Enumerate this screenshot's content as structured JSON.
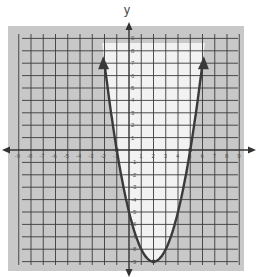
{
  "chart_data": {
    "type": "line",
    "title": "",
    "xlabel": "",
    "ylabel": "y",
    "xlim": [
      -9,
      9
    ],
    "ylim": [
      -9,
      9
    ],
    "grid": true,
    "x_ticks": [
      -9,
      -8,
      -7,
      -6,
      -5,
      -4,
      -3,
      -2,
      -1,
      1,
      2,
      3,
      4,
      5,
      6,
      7,
      8,
      9
    ],
    "y_ticks": [
      -9,
      -8,
      -7,
      -6,
      -5,
      -4,
      -3,
      -2,
      -1,
      1,
      2,
      3,
      4,
      5,
      6,
      7,
      8,
      9
    ],
    "series": [
      {
        "name": "parabola",
        "equation": "y = x^2 - 4x - 5",
        "roots": [
          -1,
          5
        ],
        "vertex": [
          2,
          -9
        ],
        "x": [
          -1.9,
          -1,
          0,
          1,
          2,
          3,
          4,
          5,
          5.9
        ],
        "values": [
          6.2,
          0,
          -5,
          -8,
          -9,
          -8,
          -5,
          0,
          6.2
        ],
        "line_style": "solid",
        "arrows": true
      }
    ],
    "shading": {
      "region": "outside parabola",
      "inequality": "y <= x^2 - 4x - 5",
      "shaded_color": "#c9c9c9",
      "unshaded_color": "#f4f4f4"
    }
  },
  "colors": {
    "grid": "#3a3a3a",
    "curve": "#3a3a3a",
    "shade": "#c8c8c8",
    "interior": "#f2f2f2"
  },
  "labels": {
    "y_axis": "y"
  }
}
